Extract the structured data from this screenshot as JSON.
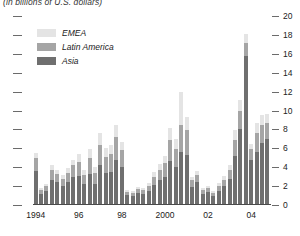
{
  "chart_data": {
    "type": "bar",
    "subtitle": "(in billions of U.S. dollars)",
    "title": "",
    "xlabel": "",
    "ylabel": "",
    "stacked": true,
    "grid": false,
    "legend_position": "top-left",
    "ylim": [
      0,
      20
    ],
    "yticks": [
      0,
      2,
      4,
      6,
      8,
      10,
      12,
      14,
      16,
      18,
      20
    ],
    "ytick_labels": [
      "0",
      "2",
      "4",
      "6",
      "8",
      "10",
      "12",
      "14",
      "16",
      "18",
      "20"
    ],
    "xtick_labels": [
      "1994",
      "96",
      "98",
      "2000",
      "02",
      "04"
    ],
    "xtick_quarters": [
      0,
      8,
      16,
      24,
      32,
      40
    ],
    "colors": {
      "EMEA": "#e4e4e4",
      "Latin America": "#a5a5a5",
      "Asia": "#6f6f6f",
      "axis": "#4a4a4a",
      "tick": "#6b6b6b",
      "text": "#1a1a1a",
      "background": "#ffffff"
    },
    "series": [
      {
        "name": "Asia",
        "values": [
          3.6,
          1.2,
          1.5,
          2.7,
          2.4,
          2.0,
          2.4,
          3.0,
          3.1,
          2.2,
          3.3,
          2.2,
          4.2,
          3.4,
          3.5,
          4.8,
          4.0,
          1.1,
          1.0,
          1.3,
          1.2,
          1.5,
          2.1,
          2.6,
          3.0,
          4.7,
          4.0,
          5.6,
          5.3,
          1.9,
          2.4,
          1.2,
          1.4,
          1.0,
          1.5,
          2.0,
          2.8,
          5.2,
          8.0,
          15.8,
          4.8,
          5.6,
          6.6,
          7.0
        ]
      },
      {
        "name": "Latin America",
        "values": [
          1.4,
          0.4,
          0.5,
          1.0,
          0.9,
          0.8,
          1.0,
          1.2,
          1.5,
          1.0,
          1.7,
          1.2,
          2.2,
          1.7,
          1.9,
          2.4,
          1.8,
          0.3,
          0.3,
          0.4,
          0.4,
          0.5,
          0.9,
          1.1,
          1.4,
          2.2,
          1.9,
          2.9,
          2.6,
          0.7,
          0.8,
          0.4,
          0.4,
          0.3,
          0.5,
          0.7,
          0.9,
          1.7,
          2.0,
          1.3,
          1.1,
          2.0,
          1.9,
          1.7
        ]
      },
      {
        "name": "EMEA",
        "values": [
          0.5,
          0.2,
          0.2,
          0.5,
          0.4,
          0.4,
          0.5,
          0.6,
          0.8,
          0.5,
          0.9,
          0.6,
          1.2,
          0.9,
          1.0,
          1.3,
          0.9,
          0.2,
          0.2,
          0.2,
          0.2,
          0.3,
          0.5,
          0.6,
          0.8,
          1.3,
          1.1,
          3.5,
          1.4,
          0.4,
          0.4,
          0.2,
          0.2,
          0.2,
          0.3,
          0.4,
          0.5,
          1.0,
          1.1,
          1.0,
          0.6,
          1.1,
          1.0,
          0.9
        ]
      }
    ],
    "legend": [
      {
        "label": "EMEA",
        "color": "#e4e4e4"
      },
      {
        "label": "Latin America",
        "color": "#a5a5a5"
      },
      {
        "label": "Asia",
        "color": "#6f6f6f"
      }
    ]
  }
}
